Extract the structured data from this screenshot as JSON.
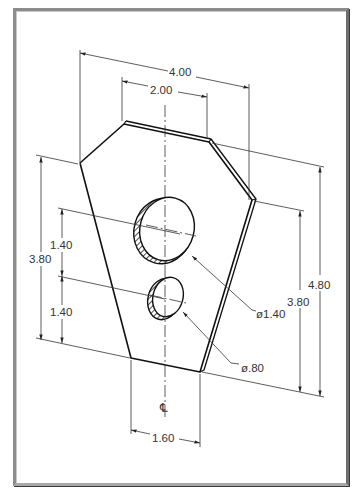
{
  "drawing": {
    "type": "isometric mechanical part drawing",
    "units_note": "inches",
    "dimensions": {
      "overall_top_width": "4.00",
      "top_flat_width": "2.00",
      "bottom_width": "1.60",
      "left_overall_height": "3.80",
      "left_upper_hole_spacing": "1.40",
      "left_lower_hole_spacing": "1.40",
      "right_inner_height": "3.80",
      "right_overall_height": "4.80",
      "large_hole_diameter": "ø1.40",
      "small_hole_diameter": "ø.80"
    },
    "centerline_symbol": "℄",
    "colors": {
      "frame": "#8c8c8c",
      "line": "#111111",
      "dim_line": "#333333",
      "background": "#ffffff"
    }
  }
}
